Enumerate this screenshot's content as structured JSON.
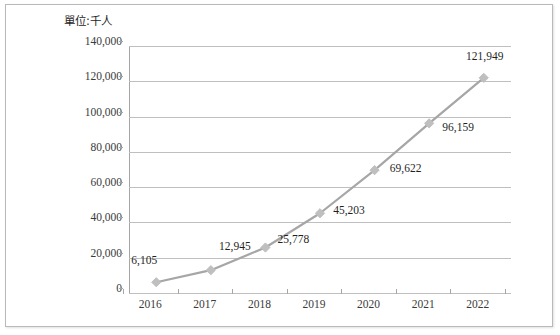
{
  "chart_data": {
    "type": "line",
    "title": "",
    "unit_label": "單位:千人",
    "xlabel": "",
    "ylabel": "",
    "categories": [
      "2016",
      "2017",
      "2018",
      "2019",
      "2020",
      "2021",
      "2022"
    ],
    "values": [
      6105,
      12945,
      25778,
      45203,
      69622,
      96159,
      121949
    ],
    "data_labels": [
      "6,105",
      "12,945",
      "25,778",
      "45,203",
      "69,622",
      "96,159",
      "121,949"
    ],
    "ylim": [
      0,
      140000
    ],
    "ytick_values": [
      0,
      20000,
      40000,
      60000,
      80000,
      100000,
      120000,
      140000
    ],
    "ytick_labels": [
      "0",
      "20,000",
      "40,000",
      "60,000",
      "80,000",
      "100,000",
      "120,000",
      "140,000"
    ],
    "grid": true,
    "legend": "none",
    "series": [
      {
        "name": "",
        "values": [
          6105,
          12945,
          25778,
          45203,
          69622,
          96159,
          121949
        ],
        "line_color": "#a6a6a6",
        "marker": "diamond",
        "marker_color": "#bfbfbf"
      }
    ],
    "colors": {
      "line": "#a6a6a6",
      "marker": "#bfbfbf",
      "grid": "#bfbfbf",
      "axis": "#a6a6a6",
      "text": "#3a3a3a",
      "border": "#b9b9b9",
      "background": "#ffffff"
    },
    "label_offsets": [
      {
        "dx": -6,
        "dy": -17
      },
      {
        "dx": 30,
        "dy": -19
      },
      {
        "dx": 34,
        "dy": -4
      },
      {
        "dx": 35,
        "dy": 2
      },
      {
        "dx": 37,
        "dy": 3
      },
      {
        "dx": 35,
        "dy": 9
      },
      {
        "dx": 7,
        "dy": -17
      }
    ]
  }
}
